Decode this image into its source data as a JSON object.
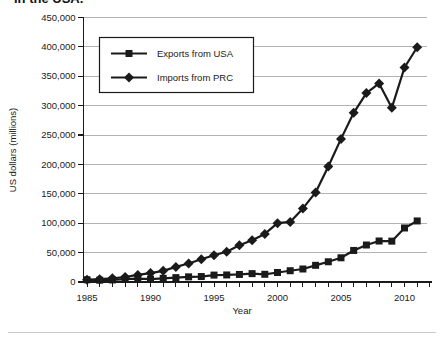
{
  "caption_fragment": "in the USA.",
  "chart_data": {
    "type": "line",
    "xlabel": "Year",
    "ylabel": "US dollars (millions)",
    "years": [
      1985,
      1986,
      1987,
      1988,
      1989,
      1990,
      1991,
      1992,
      1993,
      1994,
      1995,
      1996,
      1997,
      1998,
      1999,
      2000,
      2001,
      2002,
      2003,
      2004,
      2005,
      2006,
      2007,
      2008,
      2009,
      2010,
      2011
    ],
    "x_axis_tick_labels": [
      "1985",
      "1990",
      "1995",
      "2000",
      "2005",
      "2010"
    ],
    "y_axis": {
      "min": 0,
      "max": 450000,
      "step": 50000,
      "tick_labels": [
        "0",
        "50,000",
        "100,000",
        "150,000",
        "200,000",
        "250,000",
        "300,000",
        "350,000",
        "400,000",
        "450,000"
      ]
    },
    "series": [
      {
        "name": "Exports from USA",
        "marker": "square",
        "values": [
          3856,
          3106,
          3497,
          5021,
          5755,
          4806,
          6278,
          7419,
          8763,
          9282,
          11754,
          11993,
          12862,
          14241,
          13111,
          16185,
          19182,
          22128,
          28368,
          34428,
          41192,
          53673,
          62937,
          69733,
          69497,
          91911,
          103879
        ]
      },
      {
        "name": "Imports from PRC",
        "marker": "diamond",
        "values": [
          3862,
          4771,
          6293,
          8511,
          11990,
          15237,
          18969,
          25728,
          31540,
          38787,
          45543,
          51513,
          62558,
          71169,
          81788,
          100018,
          102278,
          125193,
          152436,
          196682,
          243470,
          287774,
          321443,
          337773,
          296374,
          364953,
          399371
        ]
      }
    ],
    "legend_position": "top-left-inside",
    "grid": "horizontal",
    "colors": {
      "line": "#1a1a1a",
      "grid": "#b3b3b3",
      "text": "#1a1a1a",
      "background": "#ffffff",
      "divider": "#c9c9c9"
    }
  }
}
